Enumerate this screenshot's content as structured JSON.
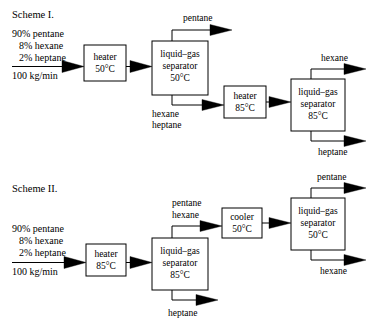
{
  "document": {
    "type": "process-flow-diagram",
    "background_color": "#ffffff",
    "line_color": "#000000"
  },
  "scheme1": {
    "label": "Scheme I.",
    "feed": {
      "line1": "90% pentane",
      "line2": "8% hexane",
      "line3": "2% heptane",
      "rate": "100 kg/min"
    },
    "units": [
      {
        "name": "heater",
        "title": "heater",
        "temp": "50°C"
      },
      {
        "name": "separator-1",
        "title1": "liquid–gas",
        "title2": "separator",
        "temp": "50°C"
      },
      {
        "name": "heater-2",
        "title": "heater",
        "temp": "85°C"
      },
      {
        "name": "separator-2",
        "title1": "liquid–gas",
        "title2": "separator",
        "temp": "85°C"
      }
    ],
    "streams": {
      "sep1_top": "pentane",
      "sep1_bottom_line1": "hexane",
      "sep1_bottom_line2": "heptane",
      "sep2_top": "hexane",
      "sep2_bottom": "heptane"
    }
  },
  "scheme2": {
    "label": "Scheme II.",
    "feed": {
      "line1": "90% pentane",
      "line2": "8% hexane",
      "line3": "2% heptane",
      "rate": "100 kg/min"
    },
    "units": [
      {
        "name": "heater",
        "title": "heater",
        "temp": "85°C"
      },
      {
        "name": "separator-1",
        "title1": "liquid–gas",
        "title2": "separator",
        "temp": "85°C"
      },
      {
        "name": "cooler",
        "title": "cooler",
        "temp": "50°C"
      },
      {
        "name": "separator-2",
        "title1": "liquid–gas",
        "title2": "separator",
        "temp": "50°C"
      }
    ],
    "streams": {
      "sep1_top_line1": "pentane",
      "sep1_top_line2": "hexane",
      "sep1_bottom": "heptane",
      "sep2_top": "pentane",
      "sep2_bottom": "hexane"
    }
  }
}
